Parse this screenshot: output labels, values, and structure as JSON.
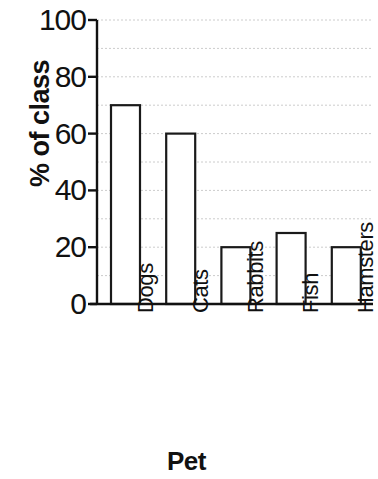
{
  "chart_data": {
    "type": "bar",
    "title": "",
    "xlabel": "Pet",
    "ylabel": "% of class",
    "categories": [
      "Dogs",
      "Cats",
      "Rabbits",
      "Fish",
      "Hamsters"
    ],
    "values": [
      70,
      60,
      20,
      25,
      20
    ],
    "ylim": [
      0,
      100
    ],
    "ytick_labels": [
      "0",
      "20",
      "40",
      "60",
      "80",
      "100"
    ],
    "ytick_values": [
      0,
      20,
      40,
      60,
      80,
      100
    ],
    "gridline_values": [
      10,
      20,
      30,
      40,
      50,
      60,
      70,
      80,
      90,
      100
    ],
    "grid": true,
    "grid_axis": "y",
    "legend": null,
    "bar_fill": "#ffffff",
    "bar_edge": "#1a1a1a",
    "grid_color": "#cccccc",
    "axis_color": "#111111"
  }
}
